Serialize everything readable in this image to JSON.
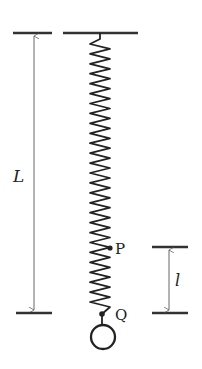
{
  "diagram": {
    "type": "spring-mass physics diagram",
    "labels": {
      "length_total": "L",
      "length_segment": "l",
      "point_upper": "P",
      "point_lower": "Q"
    },
    "colors": {
      "ink": "#222222",
      "thin_line": "#555555",
      "background": "#ffffff"
    }
  }
}
